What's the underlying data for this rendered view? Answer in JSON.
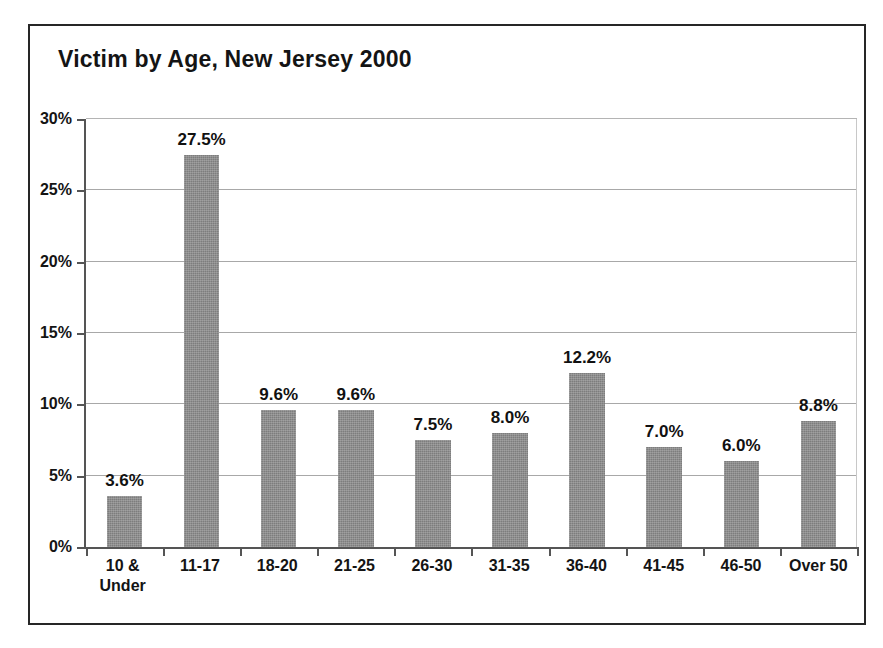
{
  "chart_data": {
    "type": "bar",
    "title": "Victim by Age, New Jersey 2000",
    "xlabel": "",
    "ylabel": "",
    "ylim": [
      0,
      30
    ],
    "y_tick_step": 5,
    "y_tick_labels": [
      "30%",
      "25%",
      "20%",
      "15%",
      "10%",
      "5%",
      "0%"
    ],
    "y_tick_values": [
      30,
      25,
      20,
      15,
      10,
      5,
      0
    ],
    "grid": true,
    "grid_axis": "y",
    "legend": "none",
    "value_suffix": "%",
    "categories": [
      "10 &\nUnder",
      "11-17",
      "18-20",
      "21-25",
      "26-30",
      "31-35",
      "36-40",
      "41-45",
      "46-50",
      "Over 50"
    ],
    "values": [
      3.6,
      27.5,
      9.6,
      9.6,
      7.5,
      8.0,
      12.2,
      7.0,
      6.0,
      8.8
    ],
    "data_labels": [
      "3.6%",
      "27.5%",
      "9.6%",
      "9.6%",
      "7.5%",
      "8.0%",
      "12.2%",
      "7.0%",
      "6.0%",
      "8.8%"
    ],
    "bar_color": "#7d7d7d",
    "axis_color": "#555555",
    "grid_color": "#a8a8a8",
    "text_color": "#141414",
    "frame_color": "#262626",
    "background": "#ffffff"
  }
}
